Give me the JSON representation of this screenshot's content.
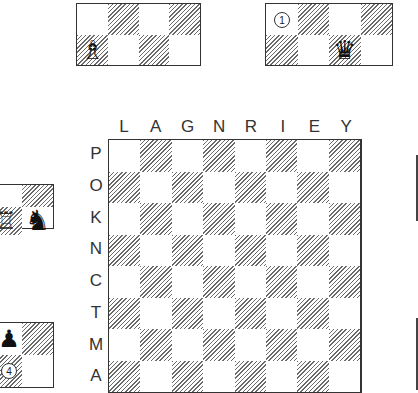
{
  "board": {
    "files": [
      "L",
      "A",
      "G",
      "N",
      "R",
      "I",
      "E",
      "Y"
    ],
    "ranks": [
      "P",
      "O",
      "K",
      "N",
      "C",
      "T",
      "M",
      "A"
    ]
  },
  "mini_top_left": {
    "rows": 2,
    "cols": 4,
    "pieces": [
      {
        "row": 1,
        "col": 0,
        "glyph": "♗",
        "name": "white-bishop-icon"
      }
    ]
  },
  "mini_top_right": {
    "rows": 2,
    "cols": 4,
    "marker": {
      "row": 0,
      "col": 0,
      "label": "1"
    },
    "pieces": [
      {
        "row": 1,
        "col": 2,
        "glyph": "♛",
        "name": "black-queen-icon"
      }
    ]
  },
  "mini_left_knight": {
    "pieces": [
      {
        "glyph": "♖",
        "name": "white-rook-icon"
      },
      {
        "glyph": "♞",
        "name": "black-knight-icon"
      }
    ]
  },
  "mini_left_pawn": {
    "marker": {
      "label": "4"
    },
    "pieces": [
      {
        "glyph": "♟",
        "name": "black-pawn-icon"
      }
    ]
  },
  "colors": {
    "border": "#333333",
    "hatch": "#6a6a6a",
    "light": "#ffffff"
  }
}
